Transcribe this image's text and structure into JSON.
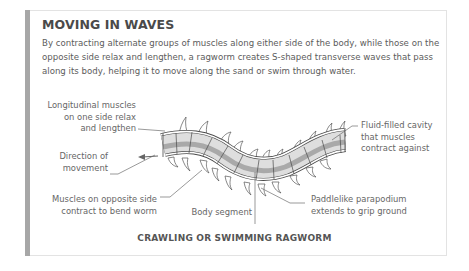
{
  "panel": {
    "title": "MOVING IN WAVES",
    "intro": "By contracting alternate groups of muscles along either side of the body, while those on the opposite side relax and lengthen, a ragworm creates S-shaped transverse waves that pass along its body, helping it to move along the sand or swim through water."
  },
  "labels": {
    "longitudinal": [
      "Longitudinal muscles",
      "on one side relax",
      "and lengthen"
    ],
    "direction": [
      "Direction of",
      "movement"
    ],
    "muscles_opposite": [
      "Muscles on opposite side",
      "contract to bend worm"
    ],
    "body_segment": "Body segment",
    "paddlelike": [
      "Paddlelike parapodium",
      "extends to grip ground"
    ],
    "fluid": [
      "Fluid-filled cavity",
      "that muscles",
      "contract against"
    ]
  },
  "caption": "CRAWLING OR SWIMMING RAGWORM",
  "colors": {
    "accent_bar": "#a7a7a7",
    "worm_light": "#dedede",
    "worm_dark": "#a9a9a9",
    "outline": "#4a4a4a"
  }
}
